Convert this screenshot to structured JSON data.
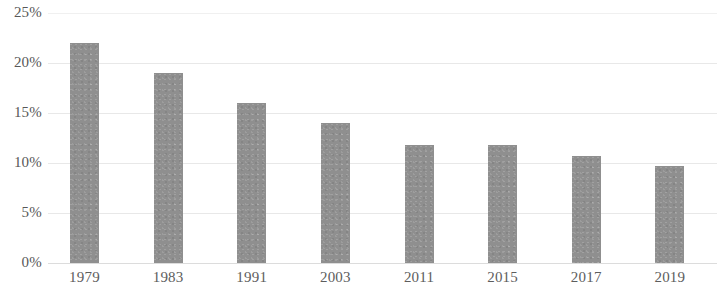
{
  "chart_data": {
    "type": "bar",
    "title": "",
    "subtitle": "",
    "xlabel": "",
    "ylabel": "",
    "categories": [
      "1979",
      "1983",
      "1991",
      "2003",
      "2011",
      "2015",
      "2017",
      "2019"
    ],
    "values": [
      22,
      19,
      16,
      14,
      11.8,
      11.8,
      10.7,
      9.7
    ],
    "value_labels": [
      "",
      "",
      "",
      "",
      "",
      "",
      "",
      ""
    ],
    "ylim": [
      0,
      25
    ],
    "y_ticks": [
      0,
      5,
      10,
      15,
      20,
      25
    ],
    "y_tick_labels": [
      "0%",
      "5%",
      "10%",
      "15%",
      "20%",
      "25%"
    ],
    "grid": true,
    "grid_axis": "y",
    "legend": false,
    "legend_position": "none",
    "series": [
      {
        "name": "",
        "values": [
          22,
          19,
          16,
          14,
          11.8,
          11.8,
          10.7,
          9.7
        ]
      }
    ]
  },
  "colors": {
    "bar": "#8f8f8f",
    "gridline": "#e8e8e8",
    "baseline": "#dcdcdc",
    "tick_text": "#585858",
    "background": "#ffffff"
  }
}
